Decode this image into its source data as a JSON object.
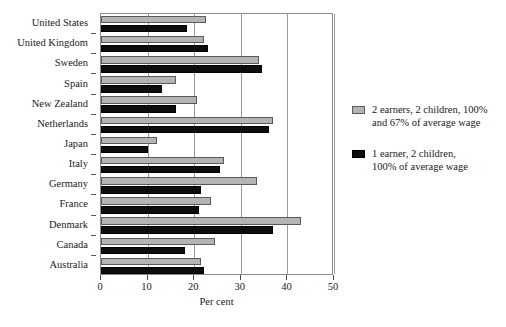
{
  "chart_data": {
    "type": "bar",
    "orientation": "horizontal",
    "title": "",
    "xlabel": "Per cent",
    "ylabel": "",
    "xlim": [
      0,
      50
    ],
    "xticks": [
      0,
      10,
      20,
      30,
      40,
      50
    ],
    "xtick_labels": [
      "0",
      "10",
      "20",
      "30",
      "40",
      "50"
    ],
    "grid": true,
    "grid_axis": "x",
    "legend_position": "right",
    "categories": [
      "United States",
      "United Kingdom",
      "Sweden",
      "Spain",
      "New Zealand",
      "Netherlands",
      "Japan",
      "Italy",
      "Germany",
      "France",
      "Denmark",
      "Canada",
      "Australia"
    ],
    "series": [
      {
        "name": "2 earners, 2 children, 100% and 67% of average wage",
        "color": "#b4b4b4",
        "values": [
          22.5,
          22.0,
          34.0,
          16.0,
          20.5,
          37.0,
          12.0,
          26.5,
          33.5,
          23.5,
          43.0,
          24.5,
          21.5
        ]
      },
      {
        "name": "1 earner, 2 children, 100% of average wage",
        "color": "#0d0d0d",
        "values": [
          18.5,
          23.0,
          34.5,
          13.0,
          16.0,
          36.0,
          10.0,
          25.5,
          21.5,
          21.0,
          37.0,
          18.0,
          22.0
        ]
      }
    ]
  },
  "legend": {
    "items": [
      {
        "label_line1": "2 earners, 2 children, 100%",
        "label_line2": "and 67% of average wage"
      },
      {
        "label_line1": "1 earner, 2 children,",
        "label_line2": "100% of average wage"
      }
    ]
  }
}
